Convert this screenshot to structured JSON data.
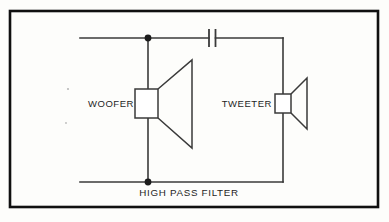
{
  "figure": {
    "caption": "HIGH PASS FILTER",
    "background_color": "#fdfdfb",
    "ink_color": "#3a3a3a",
    "frame_color": "#101010"
  },
  "labels": {
    "woofer": "WOOFER",
    "tweeter": "TWEETER"
  },
  "components": {
    "capacitor": {
      "name": "capacitor",
      "symbol": "two parallel plates",
      "plate_x_left": 209,
      "plate_x_right": 215.5,
      "plate_top": 29,
      "plate_bottom": 47
    },
    "woofer_driver": {
      "name": "woofer",
      "box": {
        "x": 135,
        "y": 89,
        "width": 23,
        "height": 29
      },
      "cone_tip_x": 192,
      "cone_top_y": 60,
      "cone_bottom_y": 148
    },
    "tweeter_driver": {
      "name": "tweeter",
      "box": {
        "x": 275,
        "y": 94,
        "width": 16,
        "height": 19
      },
      "cone_tip_x": 307,
      "cone_top_y": 78,
      "cone_bottom_y": 129
    },
    "junction_nodes": [
      {
        "name": "top-junction",
        "x": 148,
        "y": 38
      },
      {
        "name": "bottom-junction",
        "x": 148,
        "y": 182
      }
    ]
  },
  "wiring": {
    "top_rail_y": 38,
    "bottom_rail_y": 182,
    "left_end_x": 80,
    "right_branch_x": 283,
    "woofer_branch_x": 148
  },
  "frame": {
    "x": 10,
    "y": 11,
    "width": 368,
    "height": 196
  }
}
